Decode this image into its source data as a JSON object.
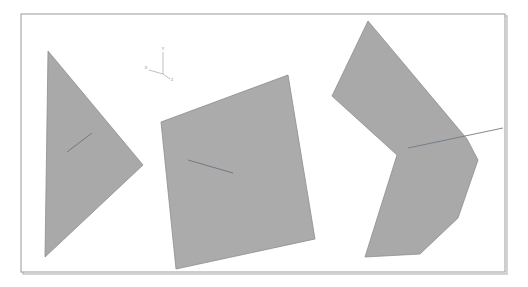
{
  "viewport": {
    "width": 528,
    "height": 287,
    "background_color": "#ffffff",
    "border_color": "#9a9a9a",
    "border_shadow_color": "#c9c9c9",
    "frame": {
      "x": 21,
      "y": 14,
      "width": 484,
      "height": 258
    }
  },
  "style": {
    "shape_fill": "#a9a9a9",
    "shape_fill_alt": "#ababab",
    "shape_edge": "#8e8e8e",
    "feature_line_color": "#6e7a86",
    "axis_color": "#b8b8b8",
    "axis_label_color": "#8d8d8d"
  },
  "axis_triad": {
    "name": "orientation-triad",
    "origin": {
      "x": 163,
      "y": 74
    },
    "axes": [
      {
        "label": "Y",
        "tip_x": 163,
        "tip_y": 52,
        "label_x": 163,
        "label_y": 50
      },
      {
        "label": "X",
        "tip_x": 149,
        "tip_y": 70,
        "label_x": 146,
        "label_y": 69
      },
      {
        "label": "Z",
        "tip_x": 170,
        "tip_y": 79,
        "label_x": 172,
        "label_y": 81
      }
    ]
  },
  "shapes": [
    {
      "name": "triangle-part",
      "type": "polygon",
      "points": "48,51 143,165 45,257",
      "feature_lines": [
        {
          "x1": 67,
          "y1": 152,
          "x2": 92,
          "y2": 133
        }
      ]
    },
    {
      "name": "quadrilateral-part",
      "type": "polygon",
      "points": "288,75 161,122 176,269 315,239",
      "feature_lines": [
        {
          "x1": 188,
          "y1": 160,
          "x2": 233,
          "y2": 173
        }
      ]
    },
    {
      "name": "chevron-part",
      "type": "polygon",
      "points": "368,21 467,139 478,160 458,218 420,254 365,257 397,155 332,96",
      "feature_lines": [
        {
          "x1": 408,
          "y1": 148,
          "x2": 503,
          "y2": 128
        }
      ]
    }
  ],
  "labels": {
    "title": "",
    "caption": ""
  }
}
